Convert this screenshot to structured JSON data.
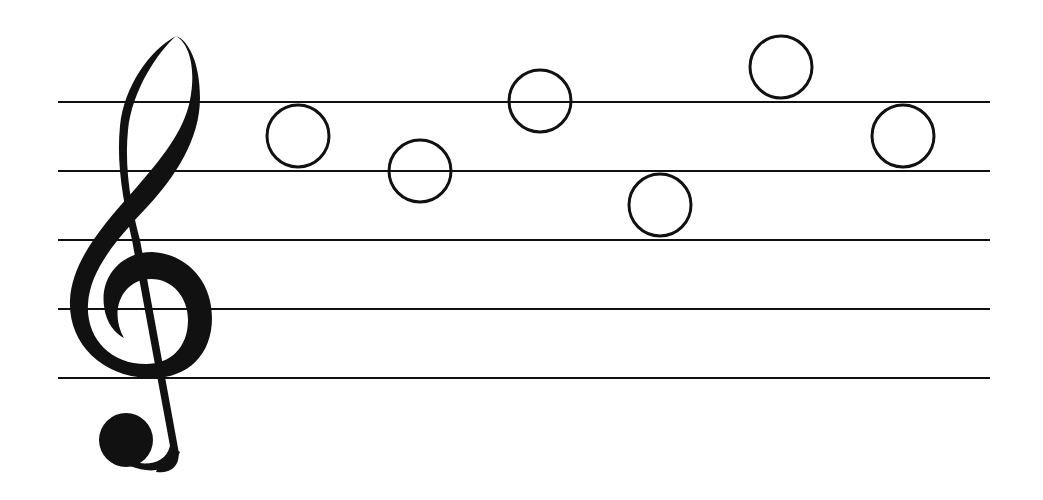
{
  "canvas": {
    "width": 1043,
    "height": 500,
    "background": "#ffffff",
    "ink": "#111111"
  },
  "staff": {
    "x_start": 58,
    "x_end": 990,
    "line_ys": [
      102,
      171,
      240,
      309,
      378
    ],
    "line_width": 2
  },
  "clef": {
    "type": "treble-clef",
    "x": 60,
    "y": 32,
    "height": 440
  },
  "notes": [
    {
      "type": "whole-note-open",
      "cx": 298,
      "cy": 136,
      "r": 31,
      "position": "space-4"
    },
    {
      "type": "whole-note-open",
      "cx": 420,
      "cy": 171,
      "r": 31,
      "position": "line-4"
    },
    {
      "type": "whole-note-open",
      "cx": 540,
      "cy": 101,
      "r": 31,
      "position": "line-5"
    },
    {
      "type": "whole-note-open",
      "cx": 660,
      "cy": 205,
      "r": 31,
      "position": "space-3"
    },
    {
      "type": "whole-note-open",
      "cx": 781,
      "cy": 67,
      "r": 31,
      "position": "above-staff"
    },
    {
      "type": "whole-note-open",
      "cx": 903,
      "cy": 136,
      "r": 31,
      "position": "space-4"
    }
  ]
}
